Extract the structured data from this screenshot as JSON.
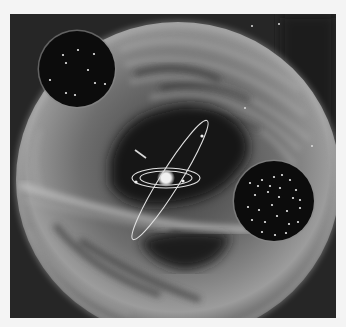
{
  "illustration": {
    "subject": "solar-system-within-cloud-shell",
    "frame": {
      "x": 10,
      "y": 14,
      "width": 326,
      "height": 304,
      "background": "#2a2a2a",
      "page_background": "#f4f4f4"
    },
    "shell": {
      "cx": 178,
      "cy": 180,
      "rx": 162,
      "ry": 158,
      "color": "#9a9a9a"
    },
    "central_star": {
      "cx": 166,
      "cy": 178,
      "r": 5,
      "color": "#f0f0f0"
    },
    "orbits": [
      {
        "name": "inner-orbit",
        "cx": 166,
        "cy": 178,
        "rx": 26,
        "ry": 7,
        "rotate": 0
      },
      {
        "name": "outer-orbit",
        "cx": 166,
        "cy": 178,
        "rx": 34,
        "ry": 10,
        "rotate": 0
      },
      {
        "name": "inclined-orbit",
        "cx": 170,
        "cy": 180,
        "rx": 70,
        "ry": 10,
        "rotate": -58
      }
    ],
    "insets": [
      {
        "name": "sparse-star-field-inset",
        "cx": 77,
        "cy": 69,
        "r": 38,
        "stars": [
          [
            63,
            55
          ],
          [
            78,
            50
          ],
          [
            94,
            54
          ],
          [
            66,
            63
          ],
          [
            88,
            70
          ],
          [
            50,
            80
          ],
          [
            95,
            83
          ],
          [
            105,
            84
          ],
          [
            66,
            93
          ],
          [
            75,
            95
          ]
        ]
      },
      {
        "name": "dense-star-field-inset",
        "cx": 274,
        "cy": 201,
        "r": 40,
        "stars": [
          [
            250,
            183
          ],
          [
            262,
            180
          ],
          [
            274,
            177
          ],
          [
            282,
            175
          ],
          [
            290,
            180
          ],
          [
            296,
            190
          ],
          [
            255,
            195
          ],
          [
            268,
            192
          ],
          [
            279,
            197
          ],
          [
            293,
            198
          ],
          [
            248,
            207
          ],
          [
            259,
            210
          ],
          [
            272,
            205
          ],
          [
            287,
            211
          ],
          [
            300,
            208
          ],
          [
            252,
            220
          ],
          [
            265,
            222
          ],
          [
            277,
            216
          ],
          [
            289,
            224
          ],
          [
            298,
            222
          ],
          [
            262,
            232
          ],
          [
            275,
            235
          ],
          [
            286,
            233
          ],
          [
            258,
            186
          ],
          [
            270,
            186
          ],
          [
            300,
            200
          ],
          [
            280,
            188
          ]
        ]
      }
    ],
    "background_stars": [
      [
        252,
        26
      ],
      [
        279,
        24
      ],
      [
        312,
        146
      ],
      [
        245,
        108
      ]
    ]
  }
}
